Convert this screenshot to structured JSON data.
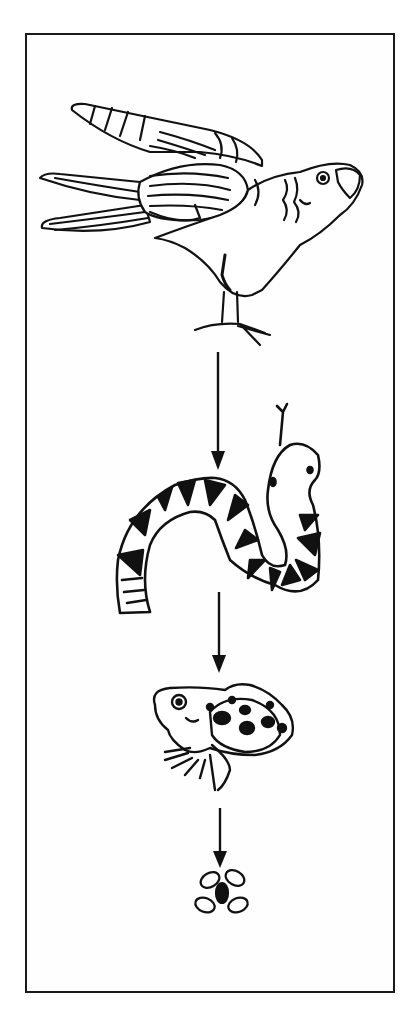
{
  "diagram": {
    "type": "food-chain",
    "direction": "top-to-bottom",
    "caption": "Food chain: hawk eats snake, snake eats frog, frog eats fly",
    "organisms": [
      {
        "id": "hawk",
        "label": "Hawk",
        "role": "tertiary consumer",
        "icon": "hawk-icon"
      },
      {
        "id": "snake",
        "label": "Snake",
        "role": "secondary consumer",
        "icon": "snake-icon"
      },
      {
        "id": "frog",
        "label": "Frog",
        "role": "primary consumer",
        "icon": "frog-icon"
      },
      {
        "id": "fly",
        "label": "Fly",
        "role": "insect",
        "icon": "fly-icon"
      }
    ],
    "arrows": [
      {
        "from": "hawk",
        "to": "snake"
      },
      {
        "from": "snake",
        "to": "frog"
      },
      {
        "from": "frog",
        "to": "fly"
      }
    ],
    "colors": {
      "ink": "#111111",
      "paper": "#ffffff",
      "frame": "#1a1a1a"
    }
  }
}
